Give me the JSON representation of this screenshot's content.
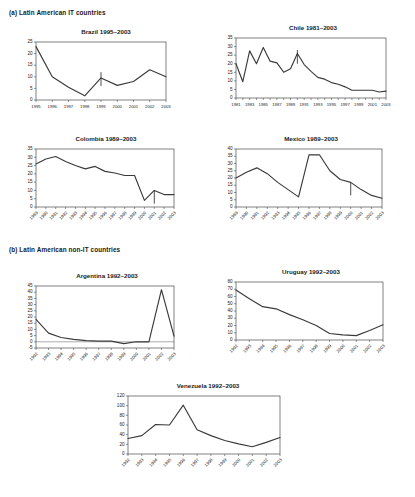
{
  "figure": {
    "sections": [
      {
        "id": "a",
        "label": "(a) Latin American IT countries"
      },
      {
        "id": "b",
        "label": "(b) Latin American non-IT countries"
      }
    ]
  },
  "chart_data": [
    {
      "type": "line",
      "title": "Brazil 1995–2003",
      "xlabel": "",
      "ylabel": "",
      "grid": false,
      "legend": "none",
      "label_rotation": 0,
      "ylim": [
        0,
        25
      ],
      "yticks": [
        0,
        5,
        10,
        15,
        20,
        25
      ],
      "categories": [
        "1995",
        "1996",
        "1997",
        "1998",
        "1999",
        "2000",
        "2001",
        "2002",
        "2003"
      ],
      "tick_labels": [
        "1995",
        "1996",
        "1997",
        "1998",
        "1999",
        "2000",
        "2001",
        "2002",
        "2003"
      ],
      "values": [
        23,
        10,
        5.5,
        1.8,
        9.5,
        6.3,
        8,
        13,
        10
      ],
      "annotations": [
        {
          "x": "1999",
          "type": "vertical-tick",
          "y_from": 12,
          "y_to": 6
        }
      ]
    },
    {
      "type": "line",
      "title": "Chile 1981–2003",
      "xlabel": "",
      "ylabel": "",
      "grid": false,
      "legend": "none",
      "label_rotation": 0,
      "ylim": [
        0,
        35
      ],
      "yticks": [
        0,
        5,
        10,
        15,
        20,
        25,
        30,
        35
      ],
      "categories": [
        "1981",
        "1982",
        "1983",
        "1984",
        "1985",
        "1986",
        "1987",
        "1988",
        "1989",
        "1990",
        "1991",
        "1992",
        "1993",
        "1994",
        "1995",
        "1996",
        "1997",
        "1998",
        "1999",
        "2000",
        "2001",
        "2002",
        "2003"
      ],
      "tick_labels": [
        "1981",
        "1983",
        "1985",
        "1987",
        "1989",
        "1991",
        "1993",
        "1995",
        "1997",
        "1999",
        "2001",
        "2003"
      ],
      "values": [
        20,
        9.5,
        27.5,
        20,
        29.5,
        21.5,
        20.5,
        15,
        17,
        26,
        19.5,
        15.5,
        12,
        11,
        9,
        8,
        6.5,
        4.5,
        4.5,
        4.5,
        4.5,
        3.5,
        4
      ],
      "annotations": [
        {
          "x": "1990",
          "type": "vertical-tick",
          "y_from": 28,
          "y_to": 20
        }
      ]
    },
    {
      "type": "line",
      "title": "Colombia 1989–2003",
      "xlabel": "",
      "ylabel": "",
      "grid": false,
      "legend": "none",
      "label_rotation": 45,
      "ylim": [
        0,
        35
      ],
      "yticks": [
        0,
        5,
        10,
        15,
        20,
        25,
        30,
        35
      ],
      "categories": [
        "1989",
        "1990",
        "1991",
        "1992",
        "1993",
        "1994",
        "1995",
        "1996",
        "1997",
        "1998",
        "1999",
        "2000",
        "2001",
        "2002",
        "2003"
      ],
      "tick_labels": [
        "1989",
        "1990",
        "1991",
        "1992",
        "1993",
        "1994",
        "1995",
        "1996",
        "1997",
        "1998",
        "1999",
        "2000",
        "2001",
        "2002",
        "2003"
      ],
      "values": [
        26,
        29,
        30.5,
        27.5,
        25,
        23,
        24.5,
        21.5,
        20.5,
        19,
        19,
        4,
        10,
        7.5,
        7.5
      ],
      "annotations": [
        {
          "x": "2001",
          "type": "vertical-tick",
          "y_from": 10,
          "y_to": 2
        }
      ]
    },
    {
      "type": "line",
      "title": "Mexico 1989–2003",
      "xlabel": "",
      "ylabel": "",
      "grid": false,
      "legend": "none",
      "label_rotation": 45,
      "ylim": [
        0,
        40
      ],
      "yticks": [
        0,
        5,
        10,
        15,
        20,
        25,
        30,
        35,
        40
      ],
      "categories": [
        "1989",
        "1990",
        "1991",
        "1992",
        "1993",
        "1994",
        "1995",
        "1996",
        "1997",
        "1998",
        "1999",
        "2000",
        "2001",
        "2002",
        "2003"
      ],
      "tick_labels": [
        "1989",
        "1990",
        "1991",
        "1992",
        "1993",
        "1994",
        "1995",
        "1996",
        "1997",
        "1998",
        "1999",
        "2000",
        "2001",
        "2002",
        "2003"
      ],
      "values": [
        20,
        24,
        27,
        23,
        17,
        12,
        7,
        36,
        36,
        25,
        19,
        17,
        12,
        8,
        6
      ],
      "annotations": [
        {
          "x": "2000",
          "type": "vertical-tick",
          "y_from": 17,
          "y_to": 8
        }
      ]
    },
    {
      "type": "line",
      "title": "Argentina 1992–2003",
      "xlabel": "",
      "ylabel": "",
      "grid": false,
      "legend": "none",
      "label_rotation": 45,
      "ylim": [
        -5,
        45
      ],
      "yticks": [
        -5,
        0,
        5,
        10,
        15,
        20,
        25,
        30,
        35,
        40,
        45
      ],
      "categories": [
        "1992",
        "1993",
        "1994",
        "1995",
        "1996",
        "1997",
        "1998",
        "1999",
        "2000",
        "2001",
        "2002",
        "2003"
      ],
      "tick_labels": [
        "1992",
        "1993",
        "1994",
        "1995",
        "1996",
        "1997",
        "1998",
        "1999",
        "2000",
        "2001",
        "2002",
        "2003"
      ],
      "values": [
        18,
        7,
        3.5,
        2,
        1,
        0.5,
        0.5,
        -1.5,
        0,
        0,
        42,
        4.5
      ],
      "annotations": []
    },
    {
      "type": "line",
      "title": "Uruguay 1992–2003",
      "xlabel": "",
      "ylabel": "",
      "grid": false,
      "legend": "none",
      "label_rotation": 45,
      "ylim": [
        0,
        80
      ],
      "yticks": [
        0,
        10,
        20,
        30,
        40,
        50,
        60,
        70,
        80
      ],
      "categories": [
        "1992",
        "1993",
        "1994",
        "1995",
        "1996",
        "1997",
        "1998",
        "1999",
        "2000",
        "2001",
        "2002",
        "2003"
      ],
      "tick_labels": [
        "1992",
        "1993",
        "1994",
        "1995",
        "1996",
        "1997",
        "1998",
        "1999",
        "2000",
        "2001",
        "2002",
        "2003"
      ],
      "values": [
        69,
        57,
        46,
        43,
        35,
        28,
        20,
        9,
        7,
        6,
        13,
        21
      ],
      "annotations": []
    },
    {
      "type": "line",
      "title": "Venezuela 1992–2003",
      "xlabel": "",
      "ylabel": "",
      "grid": false,
      "legend": "none",
      "label_rotation": 45,
      "ylim": [
        0,
        120
      ],
      "yticks": [
        0,
        20,
        40,
        60,
        80,
        100,
        120
      ],
      "categories": [
        "1992",
        "1993",
        "1994",
        "1995",
        "1996",
        "1997",
        "1998",
        "1999",
        "2000",
        "2001",
        "2002",
        "2003"
      ],
      "tick_labels": [
        "1992",
        "1993",
        "1994",
        "1995",
        "1996",
        "1997",
        "1998",
        "1999",
        "2000",
        "2001",
        "2002",
        "2003"
      ],
      "values": [
        32,
        38,
        61,
        60,
        101,
        50,
        38,
        28,
        21,
        15,
        24,
        34
      ],
      "annotations": []
    }
  ],
  "layout": {
    "panels": [
      {
        "key": "brazil",
        "chart": 0,
        "left": 16,
        "top": 28,
        "w": 180,
        "h": 92,
        "plot_w": 130,
        "plot_h": 58
      },
      {
        "key": "chile",
        "chart": 1,
        "left": 216,
        "top": 24,
        "w": 194,
        "h": 96,
        "plot_w": 150,
        "plot_h": 60
      },
      {
        "key": "colombia",
        "chart": 2,
        "left": 16,
        "top": 135,
        "w": 180,
        "h": 105,
        "plot_w": 138,
        "plot_h": 58
      },
      {
        "key": "mexico",
        "chart": 3,
        "left": 216,
        "top": 135,
        "w": 190,
        "h": 105,
        "plot_w": 146,
        "plot_h": 58
      },
      {
        "key": "argentina",
        "chart": 4,
        "left": 16,
        "top": 272,
        "w": 182,
        "h": 108,
        "plot_w": 138,
        "plot_h": 62
      },
      {
        "key": "uruguay",
        "chart": 5,
        "left": 216,
        "top": 268,
        "w": 190,
        "h": 105,
        "plot_w": 147,
        "plot_h": 58
      },
      {
        "key": "venezuela",
        "chart": 6,
        "left": 108,
        "top": 382,
        "w": 200,
        "h": 110,
        "plot_w": 152,
        "plot_h": 58
      }
    ]
  }
}
